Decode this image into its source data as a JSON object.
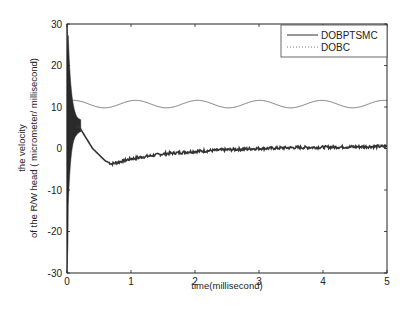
{
  "chart_data": {
    "type": "line",
    "title": "",
    "xlabel": "time(millisecond)",
    "ylabel_line1": "the velocity",
    "ylabel_line2": "of the R/W head ( micrometer/ millisecond)",
    "xlim": [
      0,
      5
    ],
    "ylim": [
      -30,
      30
    ],
    "xticks": [
      0,
      1,
      2,
      3,
      4,
      5
    ],
    "yticks": [
      -30,
      -20,
      -10,
      0,
      10,
      20,
      30
    ],
    "grid": false,
    "legend_position": "upper right",
    "series": [
      {
        "name": "DOBPTSMC",
        "style": "solid",
        "color": "#333333",
        "x": [
          0,
          0.02,
          0.05,
          0.1,
          0.15,
          0.2,
          0.3,
          0.4,
          0.5,
          0.6,
          0.7,
          0.8,
          1.0,
          1.2,
          1.5,
          2.0,
          2.5,
          3.0,
          3.5,
          4.0,
          4.5,
          5.0
        ],
        "y": [
          0,
          25,
          15,
          8,
          5.5,
          5,
          2.5,
          0,
          -1.5,
          -3,
          -3.7,
          -3.3,
          -2.5,
          -2,
          -1.3,
          -0.7,
          -0.3,
          0,
          0.2,
          0.3,
          0.4,
          0.5
        ],
        "note": "Initial high-frequency oscillation spanning roughly -30 to 30 for t < 0.1 ms"
      },
      {
        "name": "DOBC",
        "style": "dotted",
        "color": "#777777",
        "mean": 10.7,
        "amplitude": 0.9,
        "period": 0.97,
        "x_start": 0.05,
        "x_end": 5.0
      }
    ]
  },
  "legend": {
    "items": [
      {
        "label": "DOBPTSMC",
        "style": "solid"
      },
      {
        "label": "DOBC",
        "style": "dotted"
      }
    ]
  }
}
